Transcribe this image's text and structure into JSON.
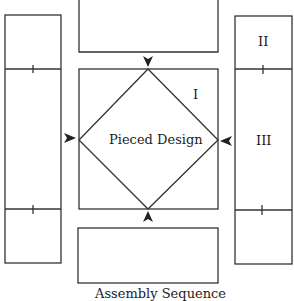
{
  "diagram": {
    "center_label": "Pieced Design",
    "section_labels": {
      "center_square": "I",
      "right_top": "II",
      "right_middle": "III"
    },
    "caption": "Assembly Sequence",
    "colors": {
      "stroke": "#333333",
      "background": "#ffffff",
      "text": "#222222"
    },
    "pieces": [
      {
        "name": "left-strip",
        "x": 5,
        "y": 15,
        "w": 56,
        "h": 248,
        "dividers_y": [
          69,
          209
        ]
      },
      {
        "name": "top-rectangle",
        "x": 79,
        "y": -2,
        "w": 139,
        "h": 54
      },
      {
        "name": "center-square",
        "x": 79,
        "y": 69,
        "w": 139,
        "h": 140
      },
      {
        "name": "bottom-rectangle",
        "x": 78,
        "y": 228,
        "w": 140,
        "h": 55
      },
      {
        "name": "right-strip",
        "x": 235,
        "y": 16,
        "w": 57,
        "h": 248,
        "dividers_y": [
          69,
          210
        ]
      }
    ],
    "arrows": [
      {
        "name": "arrow-down",
        "direction": "down"
      },
      {
        "name": "arrow-up",
        "direction": "up"
      },
      {
        "name": "arrow-right",
        "direction": "right"
      },
      {
        "name": "arrow-left",
        "direction": "left"
      }
    ]
  }
}
